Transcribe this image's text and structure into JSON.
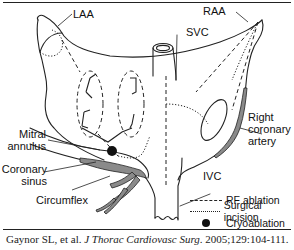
{
  "figure": {
    "labels": {
      "laa": "LAA",
      "raa": "RAA",
      "svc": "SVC",
      "right_coronary_artery_line1": "Right",
      "right_coronary_artery_line2": "coronary",
      "right_coronary_artery_line3": "artery",
      "mitral_annulus_line1": "Mitral",
      "mitral_annulus_line2": "annulus",
      "coronary_sinus_line1": "Coronary",
      "coronary_sinus_line2": "sinus",
      "circumflex": "Circumflex",
      "ivc": "IVC"
    },
    "legend": [
      {
        "style": "dashed",
        "label": "RF ablation"
      },
      {
        "style": "dotted",
        "label": "Surgical incision"
      },
      {
        "style": "filled-circle",
        "label": "Cryoablation"
      }
    ],
    "colors": {
      "line": "#222222",
      "vessel_fill": "#8a8a8a",
      "background": "#ffffff"
    }
  },
  "citation": {
    "authors": "Gaynor SL, et al.",
    "journal": "J Thorac Cardiovasc Surg",
    "details": ". 2005;129:104-111."
  }
}
